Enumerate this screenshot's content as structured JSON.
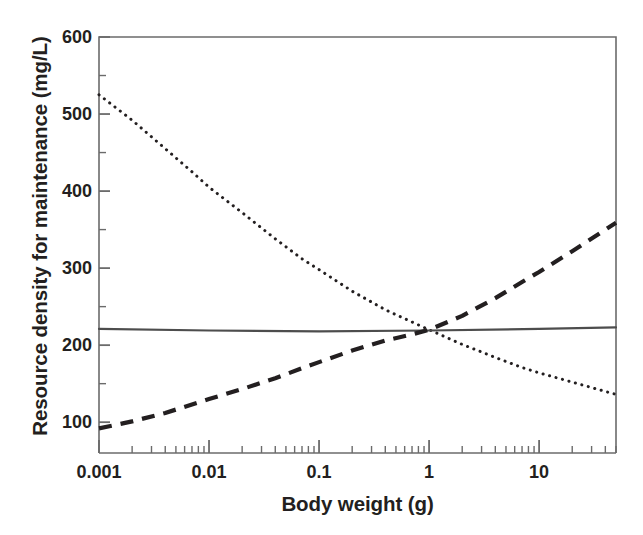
{
  "chart_data": {
    "type": "line",
    "title": "",
    "xlabel": "Body weight (g)",
    "ylabel": "Resource density for maintenance (mg/L)",
    "xscale": "log",
    "yscale": "linear",
    "xlim": [
      0.001,
      50
    ],
    "ylim": [
      60,
      600
    ],
    "grid": false,
    "legend": "none",
    "xticks": [
      {
        "value": 0.001,
        "label": "0.001",
        "major": true
      },
      {
        "value": 0.002,
        "label": "",
        "major": false
      },
      {
        "value": 0.003,
        "label": "",
        "major": false
      },
      {
        "value": 0.004,
        "label": "",
        "major": false
      },
      {
        "value": 0.005,
        "label": "",
        "major": false
      },
      {
        "value": 0.006,
        "label": "",
        "major": false
      },
      {
        "value": 0.007,
        "label": "",
        "major": false
      },
      {
        "value": 0.008,
        "label": "",
        "major": false
      },
      {
        "value": 0.009,
        "label": "",
        "major": false
      },
      {
        "value": 0.01,
        "label": "0.01",
        "major": true
      },
      {
        "value": 0.02,
        "label": "",
        "major": false
      },
      {
        "value": 0.03,
        "label": "",
        "major": false
      },
      {
        "value": 0.04,
        "label": "",
        "major": false
      },
      {
        "value": 0.05,
        "label": "",
        "major": false
      },
      {
        "value": 0.06,
        "label": "",
        "major": false
      },
      {
        "value": 0.07,
        "label": "",
        "major": false
      },
      {
        "value": 0.08,
        "label": "",
        "major": false
      },
      {
        "value": 0.09,
        "label": "",
        "major": false
      },
      {
        "value": 0.1,
        "label": "0.1",
        "major": true
      },
      {
        "value": 0.2,
        "label": "",
        "major": false
      },
      {
        "value": 0.3,
        "label": "",
        "major": false
      },
      {
        "value": 0.4,
        "label": "",
        "major": false
      },
      {
        "value": 0.5,
        "label": "",
        "major": false
      },
      {
        "value": 0.6,
        "label": "",
        "major": false
      },
      {
        "value": 0.7,
        "label": "",
        "major": false
      },
      {
        "value": 0.8,
        "label": "",
        "major": false
      },
      {
        "value": 0.9,
        "label": "",
        "major": false
      },
      {
        "value": 1,
        "label": "1",
        "major": true
      },
      {
        "value": 2,
        "label": "",
        "major": false
      },
      {
        "value": 3,
        "label": "",
        "major": false
      },
      {
        "value": 4,
        "label": "",
        "major": false
      },
      {
        "value": 5,
        "label": "",
        "major": false
      },
      {
        "value": 6,
        "label": "",
        "major": false
      },
      {
        "value": 7,
        "label": "",
        "major": false
      },
      {
        "value": 8,
        "label": "",
        "major": false
      },
      {
        "value": 9,
        "label": "",
        "major": false
      },
      {
        "value": 10,
        "label": "10",
        "major": true
      },
      {
        "value": 20,
        "label": "",
        "major": false
      },
      {
        "value": 30,
        "label": "",
        "major": false
      },
      {
        "value": 40,
        "label": "",
        "major": false
      },
      {
        "value": 50,
        "label": "",
        "major": false
      }
    ],
    "yticks": [
      {
        "value": 600,
        "label": "600",
        "major": true
      },
      {
        "value": 550,
        "label": "",
        "major": false
      },
      {
        "value": 500,
        "label": "500",
        "major": true
      },
      {
        "value": 450,
        "label": "",
        "major": false
      },
      {
        "value": 400,
        "label": "400",
        "major": true
      },
      {
        "value": 350,
        "label": "",
        "major": false
      },
      {
        "value": 300,
        "label": "300",
        "major": true
      },
      {
        "value": 250,
        "label": "",
        "major": false
      },
      {
        "value": 200,
        "label": "200",
        "major": true
      },
      {
        "value": 150,
        "label": "",
        "major": false
      },
      {
        "value": 100,
        "label": "100",
        "major": true
      }
    ],
    "series": [
      {
        "name": "decreasing-dotted",
        "style": "dotted",
        "color": "#231f20",
        "width": 2.6,
        "points": [
          {
            "x": 0.001,
            "y": 525
          },
          {
            "x": 0.002,
            "y": 492
          },
          {
            "x": 0.004,
            "y": 455
          },
          {
            "x": 0.007,
            "y": 425
          },
          {
            "x": 0.01,
            "y": 405
          },
          {
            "x": 0.02,
            "y": 372
          },
          {
            "x": 0.04,
            "y": 338
          },
          {
            "x": 0.07,
            "y": 312
          },
          {
            "x": 0.1,
            "y": 298
          },
          {
            "x": 0.2,
            "y": 270
          },
          {
            "x": 0.4,
            "y": 246
          },
          {
            "x": 0.7,
            "y": 230
          },
          {
            "x": 1,
            "y": 220
          },
          {
            "x": 2,
            "y": 201
          },
          {
            "x": 4,
            "y": 184
          },
          {
            "x": 7,
            "y": 171
          },
          {
            "x": 10,
            "y": 164
          },
          {
            "x": 20,
            "y": 152
          },
          {
            "x": 50,
            "y": 136
          }
        ]
      },
      {
        "name": "flat-solid",
        "style": "solid",
        "color": "#4d4d4d",
        "width": 2.2,
        "points": [
          {
            "x": 0.001,
            "y": 221
          },
          {
            "x": 0.01,
            "y": 219
          },
          {
            "x": 0.1,
            "y": 218
          },
          {
            "x": 1,
            "y": 219
          },
          {
            "x": 10,
            "y": 221
          },
          {
            "x": 50,
            "y": 223
          }
        ]
      },
      {
        "name": "increasing-dashed",
        "style": "dashed",
        "color": "#231f20",
        "width": 4.2,
        "points": [
          {
            "x": 0.001,
            "y": 92
          },
          {
            "x": 0.002,
            "y": 101
          },
          {
            "x": 0.004,
            "y": 112
          },
          {
            "x": 0.007,
            "y": 123
          },
          {
            "x": 0.01,
            "y": 130
          },
          {
            "x": 0.02,
            "y": 143
          },
          {
            "x": 0.04,
            "y": 157
          },
          {
            "x": 0.07,
            "y": 170
          },
          {
            "x": 0.1,
            "y": 178
          },
          {
            "x": 0.2,
            "y": 193
          },
          {
            "x": 0.4,
            "y": 206
          },
          {
            "x": 0.7,
            "y": 214
          },
          {
            "x": 1,
            "y": 220
          },
          {
            "x": 2,
            "y": 238
          },
          {
            "x": 4,
            "y": 261
          },
          {
            "x": 7,
            "y": 282
          },
          {
            "x": 10,
            "y": 295
          },
          {
            "x": 20,
            "y": 322
          },
          {
            "x": 50,
            "y": 359
          }
        ]
      }
    ],
    "annotations": [],
    "colors": {
      "axis": "#6b6b6b",
      "text": "#231f20",
      "background": "#ffffff"
    }
  }
}
